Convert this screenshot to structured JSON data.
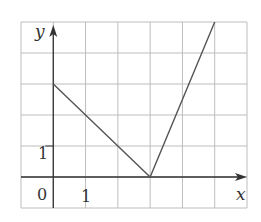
{
  "chart_data": {
    "type": "line",
    "title": "",
    "xlabel": "x",
    "ylabel": "y",
    "origin_label": "0",
    "tick_labels": {
      "x": [
        "1"
      ],
      "y": [
        "1"
      ]
    },
    "xlim": [
      -1,
      6
    ],
    "ylim": [
      -1,
      5
    ],
    "grid": true,
    "series": [
      {
        "name": "graph",
        "x": [
          0,
          3,
          5
        ],
        "y": [
          3,
          0,
          5
        ]
      }
    ]
  },
  "colors": {
    "grid": "#bdbdbd",
    "axis": "#333333",
    "line": "#555555"
  }
}
